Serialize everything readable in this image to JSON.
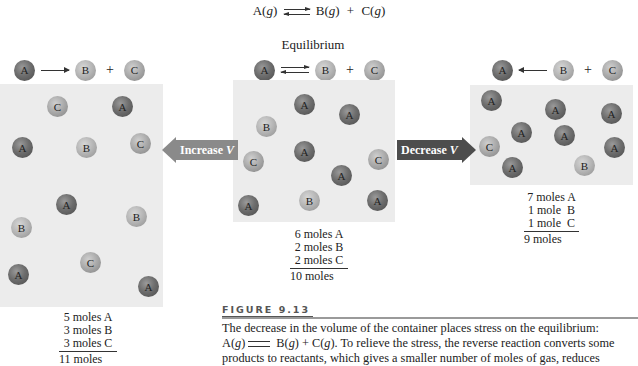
{
  "reaction": {
    "reactant": "A(",
    "reactant_state": "g",
    "reactant_close": ")",
    "product1": "B(",
    "product1_state": "g",
    "product1_close": ")",
    "plus": "+",
    "product2": "C(",
    "product2_state": "g",
    "product2_close": ")"
  },
  "center_panel": {
    "title": "Equilibrium",
    "reaction": {
      "left": "A",
      "arrow": "equilibrium",
      "mid": "B",
      "plus": "+",
      "right": "C"
    },
    "container": {
      "x": 233,
      "y": 80,
      "w": 162,
      "h": 142
    },
    "balls": [
      {
        "label": "A",
        "x": 294,
        "y": 94
      },
      {
        "label": "A",
        "x": 339,
        "y": 104
      },
      {
        "label": "B",
        "x": 256,
        "y": 116
      },
      {
        "label": "A",
        "x": 294,
        "y": 141
      },
      {
        "label": "C",
        "x": 243,
        "y": 151
      },
      {
        "label": "C",
        "x": 368,
        "y": 149
      },
      {
        "label": "A",
        "x": 331,
        "y": 165
      },
      {
        "label": "A",
        "x": 238,
        "y": 195
      },
      {
        "label": "B",
        "x": 299,
        "y": 190
      },
      {
        "label": "A",
        "x": 367,
        "y": 190
      }
    ],
    "tally": [
      "6 moles A",
      "2 moles B",
      "2 moles C"
    ],
    "total": "10 moles"
  },
  "left_panel": {
    "reaction": {
      "left": "A",
      "arrow": "forward",
      "mid": "B",
      "plus": "+",
      "right": "C"
    },
    "container": {
      "x": 0,
      "y": 84,
      "w": 163,
      "h": 223
    },
    "balls": [
      {
        "label": "C",
        "x": 47,
        "y": 96
      },
      {
        "label": "A",
        "x": 112,
        "y": 96
      },
      {
        "label": "A",
        "x": 12,
        "y": 137
      },
      {
        "label": "B",
        "x": 76,
        "y": 137
      },
      {
        "label": "C",
        "x": 130,
        "y": 133
      },
      {
        "label": "A",
        "x": 56,
        "y": 194
      },
      {
        "label": "B",
        "x": 126,
        "y": 206
      },
      {
        "label": "B",
        "x": 11,
        "y": 217
      },
      {
        "label": "C",
        "x": 80,
        "y": 252
      },
      {
        "label": "A",
        "x": 8,
        "y": 264
      },
      {
        "label": "A",
        "x": 138,
        "y": 276
      }
    ],
    "tally": [
      "5 moles A",
      "3 moles B",
      "3 moles C"
    ],
    "total": "11 moles"
  },
  "right_panel": {
    "reaction": {
      "left": "A",
      "arrow": "reverse",
      "mid": "B",
      "plus": "+",
      "right": "C"
    },
    "container": {
      "x": 470,
      "y": 85,
      "w": 163,
      "h": 100
    },
    "balls": [
      {
        "label": "A",
        "x": 481,
        "y": 90
      },
      {
        "label": "A",
        "x": 545,
        "y": 99
      },
      {
        "label": "A",
        "x": 601,
        "y": 103
      },
      {
        "label": "A",
        "x": 511,
        "y": 122
      },
      {
        "label": "A",
        "x": 554,
        "y": 125
      },
      {
        "label": "C",
        "x": 479,
        "y": 136
      },
      {
        "label": "A",
        "x": 604,
        "y": 137
      },
      {
        "label": "A",
        "x": 502,
        "y": 157
      },
      {
        "label": "B",
        "x": 574,
        "y": 155
      }
    ],
    "tally": [
      "7 moles A",
      "1 mole  B",
      "1 mole  C"
    ],
    "total": "9 moles"
  },
  "arrows": {
    "increase": {
      "label": "Increase",
      "var": "V",
      "color": "#8a8a8a"
    },
    "decrease": {
      "label": "Decrease",
      "var": "V",
      "color": "#4d4d4d"
    }
  },
  "figure": {
    "title": "FIGURE 9.13",
    "caption_line1": "The decrease in the volume of the container places stress on the equilibrium:",
    "caption_line2_a": "A(",
    "caption_line2_g1": "g",
    "caption_line2_b": ")",
    "caption_line2_c": " B(",
    "caption_line2_g2": "g",
    "caption_line2_d": ") + C(",
    "caption_line2_g3": "g",
    "caption_line2_e": "). To relieve the stress, the reverse reaction converts some",
    "caption_line3": "products to reactants, which gives a smaller number of moles of gas, reduces"
  }
}
